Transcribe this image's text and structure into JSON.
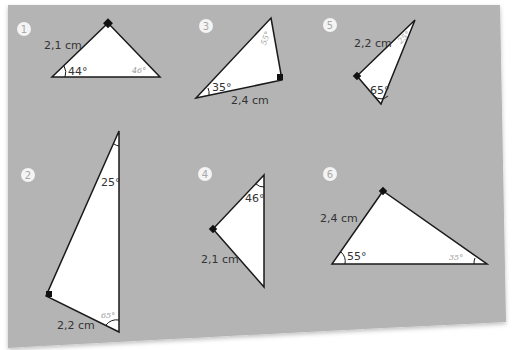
{
  "worksheet": {
    "background_color": "#b4b4b4",
    "triangle_fill": "#ffffff",
    "stroke_color": "#1a1a1a",
    "problems": [
      {
        "number": "1",
        "side_label": "2,1 cm",
        "given_angle": "44°",
        "answer_angle": "46°"
      },
      {
        "number": "2",
        "side_label": "2,2 cm",
        "given_angle": "25°",
        "answer_angle": "65°"
      },
      {
        "number": "3",
        "side_label": "2,4 cm",
        "given_angle": "35°",
        "answer_angle": "55°"
      },
      {
        "number": "4",
        "side_label": "2,1 cm",
        "given_angle": "46°"
      },
      {
        "number": "5",
        "side_label": "2,2 cm",
        "given_angle": "65°",
        "answer_angle": "25°"
      },
      {
        "number": "6",
        "side_label": "2,4 cm",
        "given_angle": "55°",
        "answer_angle": "35°"
      }
    ]
  }
}
